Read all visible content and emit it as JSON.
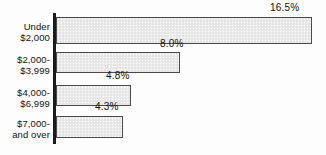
{
  "chart_data": {
    "type": "bar",
    "orientation": "horizontal",
    "title": "",
    "subtitle": "",
    "xlabel": "",
    "ylabel": "",
    "categories": [
      "Under\n$2,000",
      "$2,000-\n$3,999",
      "$4,000-\n$6,999",
      "$7,000-\nand over"
    ],
    "values": [
      16.5,
      8.0,
      4.8,
      4.3
    ],
    "data_labels": [
      "16.5%",
      "8.0%",
      "4.8%",
      "4.3%"
    ],
    "xlim": [
      0,
      16.5
    ],
    "grid": false,
    "legend": null,
    "value_unit": "%"
  },
  "style": {
    "bar_fill": "#ebebeb",
    "bar_border": "#4a4a4a",
    "axis_color": "#1a1a1a",
    "text_color": "#111111",
    "background": "#fdfdfd"
  },
  "geometry": {
    "bars": [
      {
        "top": 17,
        "height": 27,
        "width": 256,
        "label_left": 270,
        "label_top": 2,
        "cat_top": 22
      },
      {
        "top": 52,
        "height": 21,
        "width": 124,
        "label_left": 160,
        "label_top": 38,
        "cat_top": 55
      },
      {
        "top": 85,
        "height": 21,
        "width": 75,
        "label_left": 106,
        "label_top": 70,
        "cat_top": 88
      },
      {
        "top": 116,
        "height": 22,
        "width": 67,
        "label_left": 95,
        "label_top": 101,
        "cat_top": 119
      }
    ]
  }
}
